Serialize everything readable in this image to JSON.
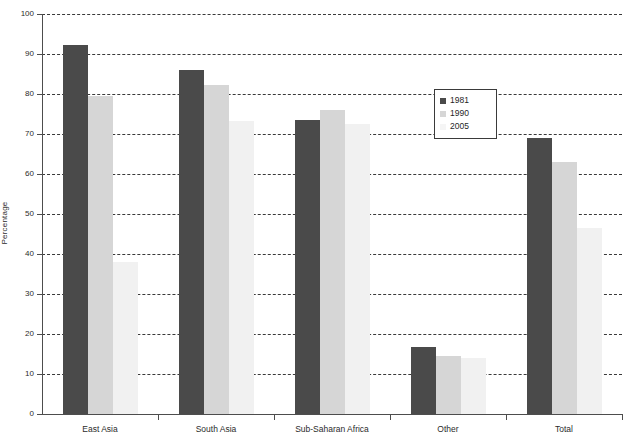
{
  "chart_data": {
    "type": "bar",
    "title": "",
    "subtitle": "",
    "xlabel": "",
    "ylabel": "Percentage",
    "ylim": [
      0,
      100
    ],
    "ytick_step": 10,
    "yticks": [
      0,
      10,
      20,
      30,
      40,
      50,
      60,
      70,
      80,
      90,
      100
    ],
    "grid": true,
    "grid_style": "dashed-horizontal",
    "legend_position": "inside-upper-right",
    "categories": [
      "East Asia",
      "South Asia",
      "Sub-Saharan Africa",
      "Other",
      "Total"
    ],
    "series": [
      {
        "name": "1981",
        "color": "#4a4a4a",
        "values": [
          92.3,
          86.1,
          73.6,
          16.8,
          69.1
        ]
      },
      {
        "name": "1990",
        "color": "#d6d6d6",
        "values": [
          79.4,
          82.2,
          76.1,
          14.4,
          62.9
        ]
      },
      {
        "name": "2005",
        "color": "#f1f1f1",
        "values": [
          38.0,
          73.2,
          72.4,
          14.1,
          46.6
        ]
      }
    ]
  },
  "legend": {
    "entries": [
      {
        "label": "1981",
        "color": "#4a4a4a"
      },
      {
        "label": "1990",
        "color": "#d6d6d6"
      },
      {
        "label": "2005",
        "color": "#f5f5f5"
      }
    ]
  },
  "axes": {
    "y_title": "Percentage",
    "y_tick_labels": [
      "0",
      "10",
      "20",
      "30",
      "40",
      "50",
      "60",
      "70",
      "80",
      "90",
      "100"
    ],
    "x_tick_labels": [
      "East Asia",
      "South Asia",
      "Sub-Saharan Africa",
      "Other",
      "Total"
    ]
  },
  "colors": {
    "axis": "#4d4d4d",
    "grid": "#3a3a3a",
    "background": "#ffffff",
    "text": "#2b2b2b",
    "series_1981": "#4a4a4a",
    "series_1990": "#d6d6d6",
    "series_2005": "#f1f1f1"
  }
}
